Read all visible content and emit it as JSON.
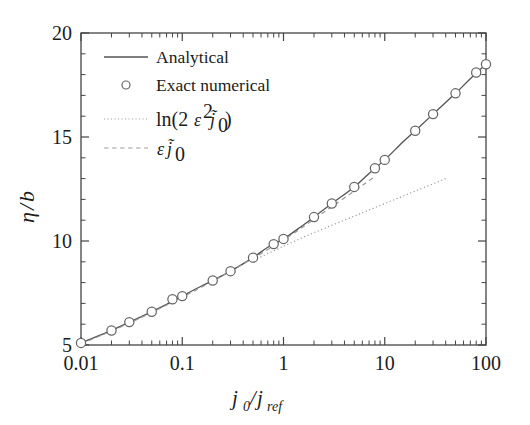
{
  "figure": {
    "background": "#ffffff",
    "frame_color": "#444444",
    "curve_color": "#555555",
    "marker_color": "#666666",
    "asymptote_color": "#999999"
  },
  "chart_data": {
    "type": "line",
    "title": "",
    "xlabel": "j0/jref",
    "xlabel_parts": {
      "num": "j",
      "num_sub": "0",
      "slash": "/",
      "den": "j",
      "den_sub": "ref"
    },
    "ylabel": "η/b",
    "ylabel_parts": {
      "eta": "η",
      "slash": "/",
      "b": "b"
    },
    "xscale": "log",
    "yscale": "linear",
    "xlim": [
      0.01,
      100
    ],
    "ylim": [
      5,
      20
    ],
    "grid": false,
    "xticks": [
      0.01,
      0.1,
      1,
      10,
      100
    ],
    "xticklabels": [
      "0.01",
      "0.1",
      "1",
      "10",
      "100"
    ],
    "yticks": [
      5,
      10,
      15,
      20
    ],
    "yticklabels": [
      "5",
      "10",
      "15",
      "20"
    ],
    "yminorticks": [
      6,
      7,
      8,
      9,
      11,
      12,
      13,
      14,
      16,
      17,
      18,
      19
    ],
    "legend_position": "upper-left",
    "legend": [
      {
        "label": "Analytical",
        "style": "solid"
      },
      {
        "label": "Exact numerical",
        "style": "marker"
      },
      {
        "label": "ln(2ε²j̃₀)",
        "style": "dotted"
      },
      {
        "label": "εj̃₀",
        "style": "dashed"
      }
    ],
    "series": [
      {
        "name": "Analytical",
        "style": "solid",
        "x": [
          0.01,
          0.015,
          0.02,
          0.03,
          0.05,
          0.07,
          0.1,
          0.15,
          0.2,
          0.3,
          0.5,
          0.7,
          1.0,
          1.5,
          2.0,
          3.0,
          5.0,
          7.0,
          10.0,
          15.0,
          20.0,
          30.0,
          50.0,
          70.0,
          100.0
        ],
        "y": [
          5.1,
          5.45,
          5.7,
          6.1,
          6.6,
          6.95,
          7.35,
          7.8,
          8.1,
          8.55,
          9.2,
          9.7,
          10.1,
          10.7,
          11.15,
          11.8,
          12.6,
          13.25,
          13.9,
          14.75,
          15.3,
          16.1,
          17.1,
          17.8,
          18.5
        ]
      },
      {
        "name": "Exact numerical",
        "style": "marker",
        "x": [
          0.01,
          0.02,
          0.03,
          0.05,
          0.08,
          0.1,
          0.2,
          0.3,
          0.5,
          0.8,
          1.0,
          2.0,
          3.0,
          5.0,
          8.0,
          10.0,
          20.0,
          30.0,
          50.0,
          80.0,
          100.0
        ],
        "y": [
          5.1,
          5.7,
          6.1,
          6.6,
          7.2,
          7.35,
          8.1,
          8.55,
          9.2,
          9.85,
          10.1,
          11.15,
          11.8,
          12.6,
          13.5,
          13.9,
          15.3,
          16.1,
          17.1,
          18.1,
          18.5
        ]
      },
      {
        "name": "ln(2ε²j̃₀)",
        "style": "dotted",
        "x": [
          0.55,
          1.0,
          2.0,
          5.0,
          10.0,
          20.0,
          40.0
        ],
        "y": [
          9.15,
          9.75,
          10.4,
          11.2,
          11.8,
          12.4,
          13.0
        ]
      },
      {
        "name": "εj̃₀",
        "style": "dashed",
        "x": [
          0.01,
          0.03,
          0.1,
          0.3,
          1.0,
          3.0,
          8.0
        ],
        "y": [
          5.05,
          6.05,
          7.3,
          8.55,
          10.05,
          11.65,
          13.1
        ]
      }
    ]
  }
}
